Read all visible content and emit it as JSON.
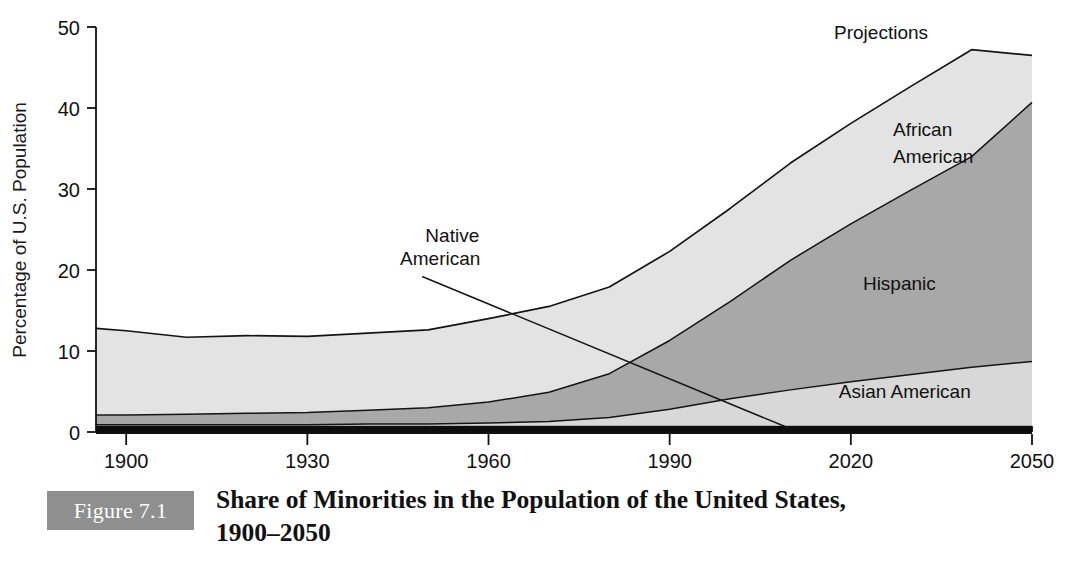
{
  "figure": {
    "badge_label": "Figure 7.1",
    "caption_line1": "Share of Minorities in the Population of the United States,",
    "caption_line2": "1900–2050",
    "badge_color": "#8f8f8f"
  },
  "chart_data": {
    "type": "area",
    "title": "Share of Minorities in the Population of the United States, 1900–2050",
    "xlabel": "",
    "ylabel": "Percentage of U.S. Population",
    "xlim": [
      1895,
      2050
    ],
    "ylim": [
      0,
      50
    ],
    "xticks": [
      1900,
      1930,
      1960,
      1990,
      2020,
      2050
    ],
    "xticklabels": [
      "1900",
      "1930",
      "1960",
      "1990",
      "2020",
      "2050"
    ],
    "yticks": [
      0,
      10,
      20,
      30,
      40,
      50
    ],
    "yticklabels": [
      "0",
      "10",
      "20",
      "30",
      "40",
      "50"
    ],
    "grid": false,
    "legend": "in-plot labels",
    "stacked": true,
    "annotations": [
      {
        "text": "Projections",
        "x": 2025,
        "y": 48.5
      },
      {
        "text": "African",
        "x": 2027,
        "y": 36.5
      },
      {
        "text": "American",
        "x": 2027,
        "y": 33.2
      },
      {
        "text": "Hispanic",
        "x": 2022,
        "y": 17.5
      },
      {
        "text": "Asian American",
        "x": 2018,
        "y": 4.2
      },
      {
        "text": "Native",
        "x": 1954,
        "y": 23.5
      },
      {
        "text": "American",
        "x": 1952,
        "y": 20.6
      }
    ],
    "leader_line": {
      "from_x": 1949,
      "from_y": 19.2,
      "to_x": 2010,
      "to_y": 0.4
    },
    "x": [
      1895,
      1900,
      1910,
      1920,
      1930,
      1940,
      1950,
      1960,
      1970,
      1980,
      1990,
      2000,
      2010,
      2020,
      2030,
      2040,
      2050
    ],
    "series": [
      {
        "name": "Native American",
        "color": "#0d0d0d",
        "values": [
          0.8,
          0.8,
          0.8,
          0.8,
          0.8,
          0.8,
          0.8,
          0.8,
          0.8,
          0.8,
          0.8,
          0.8,
          0.8,
          0.8,
          0.8,
          0.8,
          0.8
        ]
      },
      {
        "name": "Asian American",
        "color": "#d8d8d8",
        "values": [
          0.1,
          0.1,
          0.1,
          0.1,
          0.1,
          0.2,
          0.2,
          0.3,
          0.5,
          1.0,
          2.0,
          3.3,
          4.4,
          5.4,
          6.3,
          7.2,
          7.9
        ]
      },
      {
        "name": "Hispanic",
        "color": "#a8a8a8",
        "values": [
          1.2,
          1.2,
          1.3,
          1.4,
          1.5,
          1.7,
          2.0,
          2.6,
          3.6,
          5.4,
          8.5,
          12.0,
          16.0,
          19.5,
          22.8,
          26.0,
          32.0
        ]
      },
      {
        "name": "African American",
        "color": "#e3e3e3",
        "values": [
          10.7,
          10.4,
          9.5,
          9.6,
          9.4,
          9.5,
          9.6,
          10.3,
          10.6,
          10.7,
          11.0,
          11.5,
          12.0,
          12.4,
          12.8,
          13.2,
          5.8
        ]
      }
    ],
    "totals": [
      12.8,
      12.5,
      11.7,
      11.9,
      11.8,
      12.2,
      12.6,
      14.0,
      15.5,
      17.9,
      22.3,
      27.6,
      33.2,
      38.1,
      42.7,
      47.2,
      46.5
    ]
  }
}
